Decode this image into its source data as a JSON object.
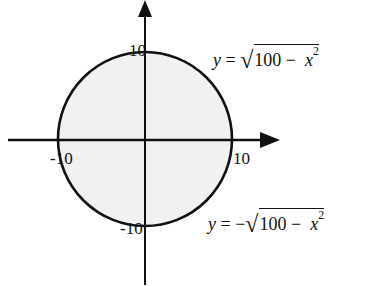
{
  "diagram": {
    "title": "",
    "center": [
      145,
      140
    ],
    "radius": 87,
    "colors": {
      "stroke": "#111111",
      "fill": "#f1f1f1",
      "background": "#ffffff"
    },
    "axis_labels": {
      "y_top": "10",
      "y_bottom": "-10",
      "x_left": "-10",
      "x_right": "10"
    },
    "equations": {
      "upper": {
        "lhs": "y",
        "eq": " = ",
        "sign": "",
        "radicand_num": "100",
        "minus": " − ",
        "var": "x",
        "exp": "2"
      },
      "lower": {
        "lhs": "y",
        "eq": " = ",
        "sign": "−",
        "radicand_num": "100",
        "minus": " − ",
        "var": "x",
        "exp": "2"
      }
    }
  }
}
